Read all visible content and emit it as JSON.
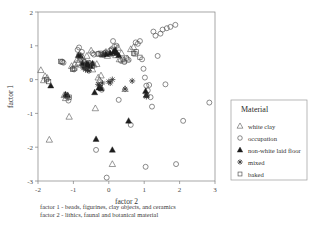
{
  "figure": {
    "background": "#ffffff",
    "frame_color": "#808080"
  },
  "axes": {
    "xlabel": "factor 2",
    "ylabel": "factor 1",
    "xticks": [
      "-2",
      "-1",
      "0",
      "1",
      "2",
      "3"
    ],
    "yticks": [
      "2",
      "1",
      "0",
      "-1",
      "-2",
      "-3"
    ]
  },
  "legend": {
    "title": "Material",
    "items": [
      {
        "label": "white clay",
        "marker": "triangle-open-icon"
      },
      {
        "label": "occupation",
        "marker": "circle-open-icon"
      },
      {
        "label": "non-white laid floor",
        "marker": "triangle-filled-icon"
      },
      {
        "label": "mixed",
        "marker": "plus-icon"
      },
      {
        "label": "baked",
        "marker": "square-open-icon"
      }
    ]
  },
  "captions": [
    "factor 1 - beads, figurines, clay objects, and ceramics",
    "factor 2 - lithics, faunal and botanical material"
  ],
  "chart_data": {
    "type": "scatter",
    "title": "",
    "xlabel": "factor 2",
    "ylabel": "factor 1",
    "xlim": [
      -2.0,
      3.0
    ],
    "ylim": [
      -3.0,
      2.0
    ],
    "grid": false,
    "legend_position": "right-outside",
    "series": [
      {
        "name": "white clay",
        "marker": "triangle-open",
        "color": "#555555",
        "points": [
          [
            -1.92,
            0.28
          ],
          [
            -1.84,
            -0.02
          ],
          [
            -1.8,
            0.1
          ],
          [
            -1.74,
            0.05
          ],
          [
            -1.68,
            -1.78
          ],
          [
            -1.26,
            -0.46
          ],
          [
            -1.22,
            -0.55
          ],
          [
            -1.12,
            -1.1
          ],
          [
            -1.05,
            0.4
          ],
          [
            -0.96,
            0.46
          ],
          [
            -0.9,
            0.58
          ],
          [
            -0.86,
            0.5
          ],
          [
            -0.82,
            0.62
          ],
          [
            -0.78,
            0.44
          ],
          [
            -0.74,
            0.66
          ],
          [
            -0.7,
            0.52
          ],
          [
            -0.66,
            0.4
          ],
          [
            -0.62,
            0.7
          ],
          [
            -0.58,
            0.33
          ],
          [
            -0.54,
            0.48
          ],
          [
            -0.5,
            0.86
          ],
          [
            -0.46,
            0.3
          ],
          [
            -0.42,
            0.44
          ],
          [
            -0.38,
            -0.85
          ],
          [
            -0.34,
            0.46
          ],
          [
            -0.3,
            0.06
          ],
          [
            -0.26,
            -0.02
          ],
          [
            -0.22,
            0.12
          ],
          [
            -0.18,
            0.74
          ],
          [
            -0.12,
            0.78
          ],
          [
            -0.08,
            0.82
          ],
          [
            -0.04,
            0.7
          ],
          [
            0.02,
            0.76
          ],
          [
            0.06,
            0.86
          ],
          [
            0.1,
            -2.5
          ],
          [
            0.14,
            0.8
          ],
          [
            0.2,
            0.72
          ],
          [
            0.26,
            0.94
          ],
          [
            0.3,
            0.6
          ],
          [
            0.36,
            0.78
          ],
          [
            0.42,
            0.56
          ],
          [
            0.46,
            -0.28
          ],
          [
            0.52,
            0.62
          ],
          [
            0.62,
            0.9
          ],
          [
            0.7,
            0.96
          ]
        ]
      },
      {
        "name": "occupation",
        "marker": "circle-open",
        "color": "#4d4d4d",
        "points": [
          [
            -1.32,
            0.53
          ],
          [
            -1.28,
            0.5
          ],
          [
            -1.18,
            -0.5
          ],
          [
            -1.14,
            -0.62
          ],
          [
            -1.02,
            0.32
          ],
          [
            -0.98,
            0.3
          ],
          [
            -0.88,
            0.88
          ],
          [
            -0.84,
            0.95
          ],
          [
            -0.8,
            0.72
          ],
          [
            -0.76,
            0.82
          ],
          [
            -0.72,
            0.55
          ],
          [
            -0.68,
            0.52
          ],
          [
            -0.64,
            0.46
          ],
          [
            -0.6,
            0.48
          ],
          [
            -0.56,
            0.5
          ],
          [
            -0.5,
            0.44
          ],
          [
            -0.46,
            0.78
          ],
          [
            -0.42,
            0.74
          ],
          [
            -0.36,
            -2.08
          ],
          [
            -0.3,
            0.76
          ],
          [
            -0.24,
            -0.24
          ],
          [
            -0.2,
            -0.3
          ],
          [
            -0.16,
            0.74
          ],
          [
            -0.1,
            0.8
          ],
          [
            -0.06,
            -2.9
          ],
          [
            0.0,
            0.76
          ],
          [
            0.04,
            0.86
          ],
          [
            0.08,
            0.9
          ],
          [
            0.12,
            1.14
          ],
          [
            0.16,
            0.98
          ],
          [
            0.22,
            1.0
          ],
          [
            0.28,
            -0.6
          ],
          [
            0.34,
            0.56
          ],
          [
            0.4,
            0.6
          ],
          [
            0.44,
            0.52
          ],
          [
            0.5,
            0.64
          ],
          [
            0.56,
            0.58
          ],
          [
            0.62,
            -1.34
          ],
          [
            0.76,
            1.1
          ],
          [
            0.82,
            1.06
          ],
          [
            0.88,
            1.14
          ],
          [
            0.94,
            0.6
          ],
          [
            0.98,
            0.32
          ],
          [
            1.02,
            0.06
          ],
          [
            1.04,
            -2.58
          ],
          [
            1.06,
            -0.18
          ],
          [
            1.1,
            -0.32
          ],
          [
            1.14,
            -0.16
          ],
          [
            1.18,
            -0.52
          ],
          [
            1.22,
            -0.8
          ],
          [
            1.26,
            1.42
          ],
          [
            1.32,
            1.3
          ],
          [
            1.38,
            0.7
          ],
          [
            1.46,
            1.36
          ],
          [
            1.52,
            1.48
          ],
          [
            1.6,
            -0.14
          ],
          [
            1.64,
            1.52
          ],
          [
            1.74,
            1.56
          ],
          [
            1.88,
            1.62
          ],
          [
            1.9,
            -2.5
          ],
          [
            2.1,
            -1.22
          ],
          [
            2.84,
            -0.68
          ]
        ]
      },
      {
        "name": "non-white laid floor",
        "marker": "triangle-filled",
        "color": "#1c1c1c",
        "points": [
          [
            -1.64,
            -0.18
          ],
          [
            -1.22,
            -0.44
          ],
          [
            -1.16,
            -0.46
          ],
          [
            -0.86,
            0.72
          ],
          [
            -0.8,
            0.7
          ],
          [
            -0.74,
            0.48
          ],
          [
            -0.68,
            0.42
          ],
          [
            -0.62,
            0.46
          ],
          [
            -0.58,
            0.44
          ],
          [
            -0.52,
            0.4
          ],
          [
            -0.46,
            0.48
          ],
          [
            -0.4,
            -0.38
          ],
          [
            -0.36,
            -1.76
          ],
          [
            -0.28,
            -0.24
          ],
          [
            -0.22,
            -0.26
          ],
          [
            -0.16,
            0.74
          ],
          [
            -0.08,
            0.76
          ],
          [
            0.04,
            0.78
          ],
          [
            0.1,
            -2.08
          ],
          [
            0.14,
            0.82
          ],
          [
            0.18,
            0.88
          ],
          [
            0.22,
            0.78
          ],
          [
            0.28,
            0.72
          ],
          [
            0.56,
            -1.22
          ],
          [
            1.04,
            -0.34
          ],
          [
            1.06,
            -0.46
          ]
        ]
      },
      {
        "name": "mixed",
        "marker": "plus",
        "color": "#2b2b2b",
        "points": [
          [
            -0.72,
            0.34
          ],
          [
            -0.66,
            0.3
          ],
          [
            -0.6,
            0.28
          ],
          [
            -0.56,
            0.26
          ],
          [
            -0.3,
            -0.14
          ],
          [
            -0.26,
            -0.18
          ],
          [
            -0.18,
            -0.1
          ],
          [
            0.0,
            -0.06
          ],
          [
            0.04,
            -0.1
          ],
          [
            0.1,
            0.0
          ],
          [
            0.46,
            -0.28
          ],
          [
            1.06,
            -0.5
          ],
          [
            1.08,
            -0.46
          ],
          [
            0.66,
            -0.04
          ]
        ]
      },
      {
        "name": "baked",
        "marker": "square-open",
        "color": "#4d4d4d",
        "points": [
          [
            -1.76,
            0.0
          ],
          [
            -1.7,
            -0.06
          ],
          [
            -1.36,
            0.54
          ],
          [
            -1.32,
            0.52
          ],
          [
            -1.2,
            -0.48
          ],
          [
            -1.12,
            -0.52
          ],
          [
            -1.02,
            0.3
          ],
          [
            -0.84,
            0.7
          ],
          [
            -0.74,
            0.46
          ],
          [
            -0.3,
            0.76
          ],
          [
            -0.24,
            0.78
          ],
          [
            -0.2,
            0.74
          ],
          [
            0.7,
            0.78
          ],
          [
            0.74,
            0.76
          ],
          [
            0.78,
            0.82
          ],
          [
            0.88,
            0.66
          ],
          [
            -0.46,
            0.4
          ],
          [
            -0.96,
            0.34
          ]
        ]
      }
    ]
  }
}
